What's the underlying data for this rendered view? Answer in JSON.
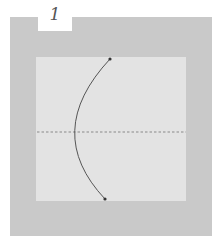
{
  "step": {
    "number": "1"
  },
  "diagram": {
    "colors": {
      "outer_background": "#c9c9c9",
      "paper": "#e3e3e3",
      "curve": "#555555",
      "dashed_line": "#8a8a8a",
      "endpoints": "#333333"
    },
    "elements": [
      "outer-frame",
      "paper-square",
      "dashed-crease",
      "curved-fold-line",
      "top-endpoint",
      "bottom-endpoint"
    ]
  }
}
